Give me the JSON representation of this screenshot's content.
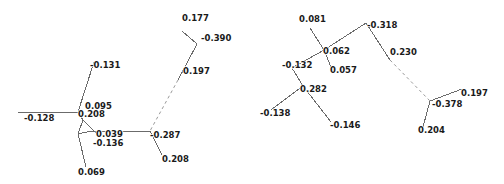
{
  "figure": {
    "background_color": "#ffffff",
    "edge_color": "#6b6b6b",
    "dashed_edge_color": "#9a9a9a",
    "label_color": "#1a1a1a",
    "width": 504,
    "height": 184
  },
  "chart_data": {
    "type": "diagram",
    "title": "",
    "panels": [
      {
        "id": "left-panel",
        "name": "left-network",
        "nodes": [
          {
            "id": "L1",
            "label": "-0.128",
            "x": 24,
            "y": 121,
            "anchor": "start"
          },
          {
            "id": "L2",
            "label": "-0.131",
            "x": 90,
            "y": 68,
            "anchor": "start"
          },
          {
            "id": "L3",
            "label": "0.095",
            "x": 85,
            "y": 109,
            "anchor": "start"
          },
          {
            "id": "L4",
            "label": "0.208",
            "x": 78,
            "y": 117,
            "anchor": "start"
          },
          {
            "id": "L5",
            "label": "0.039",
            "x": 96,
            "y": 137,
            "anchor": "start"
          },
          {
            "id": "L6",
            "label": "-0.136",
            "x": 93,
            "y": 146,
            "anchor": "start"
          },
          {
            "id": "L7",
            "label": "0.069",
            "x": 78,
            "y": 175,
            "anchor": "start"
          },
          {
            "id": "L8",
            "label": "-0.287",
            "x": 150,
            "y": 138,
            "anchor": "start"
          },
          {
            "id": "L9",
            "label": "0.208",
            "x": 162,
            "y": 162,
            "anchor": "start"
          },
          {
            "id": "L10",
            "label": "0.197",
            "x": 183,
            "y": 74,
            "anchor": "start"
          },
          {
            "id": "L11",
            "label": "0.177",
            "x": 182,
            "y": 21,
            "anchor": "start"
          },
          {
            "id": "L12",
            "label": "-0.390",
            "x": 201,
            "y": 41,
            "anchor": "start"
          }
        ],
        "solid_edges": [
          {
            "x1": 18,
            "y1": 112,
            "x2": 78,
            "y2": 112
          },
          {
            "x1": 78,
            "y1": 112,
            "x2": 94,
            "y2": 62
          },
          {
            "x1": 78,
            "y1": 112,
            "x2": 83,
            "y2": 120
          },
          {
            "x1": 83,
            "y1": 120,
            "x2": 96,
            "y2": 133
          },
          {
            "x1": 83,
            "y1": 120,
            "x2": 94,
            "y2": 131
          },
          {
            "x1": 83,
            "y1": 120,
            "x2": 78,
            "y2": 134
          },
          {
            "x1": 78,
            "y1": 134,
            "x2": 91,
            "y2": 131
          },
          {
            "x1": 78,
            "y1": 134,
            "x2": 86,
            "y2": 167
          },
          {
            "x1": 91,
            "y1": 131,
            "x2": 150,
            "y2": 131
          },
          {
            "x1": 150,
            "y1": 131,
            "x2": 162,
            "y2": 155
          },
          {
            "x1": 182,
            "y1": 31,
            "x2": 197,
            "y2": 44
          },
          {
            "x1": 197,
            "y1": 44,
            "x2": 178,
            "y2": 80
          }
        ],
        "dashed_edges": [
          {
            "x1": 178,
            "y1": 80,
            "x2": 150,
            "y2": 131
          }
        ]
      },
      {
        "id": "right-panel",
        "name": "right-network",
        "nodes": [
          {
            "id": "R1",
            "label": "0.081",
            "x": 299,
            "y": 22,
            "anchor": "start"
          },
          {
            "id": "R2",
            "label": "-0.318",
            "x": 367,
            "y": 28,
            "anchor": "start"
          },
          {
            "id": "R3",
            "label": "0.062",
            "x": 323,
            "y": 54,
            "anchor": "start"
          },
          {
            "id": "R4",
            "label": "0.057",
            "x": 330,
            "y": 73,
            "anchor": "start"
          },
          {
            "id": "R5",
            "label": "-0.132",
            "x": 282,
            "y": 68,
            "anchor": "start"
          },
          {
            "id": "R6",
            "label": "0.282",
            "x": 300,
            "y": 92,
            "anchor": "start"
          },
          {
            "id": "R7",
            "label": "-0.138",
            "x": 260,
            "y": 116,
            "anchor": "start"
          },
          {
            "id": "R8",
            "label": "-0.146",
            "x": 330,
            "y": 128,
            "anchor": "start"
          },
          {
            "id": "R9",
            "label": "0.230",
            "x": 390,
            "y": 55,
            "anchor": "start"
          },
          {
            "id": "R10",
            "label": "0.197",
            "x": 461,
            "y": 96,
            "anchor": "start"
          },
          {
            "id": "R11",
            "label": "-0.378",
            "x": 432,
            "y": 107,
            "anchor": "start"
          },
          {
            "id": "R12",
            "label": "0.204",
            "x": 418,
            "y": 133,
            "anchor": "start"
          }
        ],
        "solid_edges": [
          {
            "x1": 310,
            "y1": 28,
            "x2": 324,
            "y2": 50
          },
          {
            "x1": 324,
            "y1": 50,
            "x2": 366,
            "y2": 23
          },
          {
            "x1": 324,
            "y1": 50,
            "x2": 331,
            "y2": 67
          },
          {
            "x1": 324,
            "y1": 50,
            "x2": 292,
            "y2": 68
          },
          {
            "x1": 292,
            "y1": 68,
            "x2": 303,
            "y2": 86
          },
          {
            "x1": 303,
            "y1": 86,
            "x2": 271,
            "y2": 110
          },
          {
            "x1": 303,
            "y1": 86,
            "x2": 331,
            "y2": 122
          },
          {
            "x1": 366,
            "y1": 23,
            "x2": 390,
            "y2": 60
          },
          {
            "x1": 430,
            "y1": 101,
            "x2": 462,
            "y2": 89
          },
          {
            "x1": 430,
            "y1": 101,
            "x2": 423,
            "y2": 127
          }
        ],
        "dashed_edges": [
          {
            "x1": 390,
            "y1": 60,
            "x2": 430,
            "y2": 101
          }
        ]
      }
    ]
  }
}
